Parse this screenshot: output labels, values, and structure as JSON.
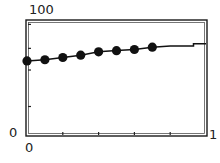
{
  "chart_data": {
    "type": "line",
    "title": "",
    "xlabel": "",
    "ylabel": "",
    "xlim": [
      0,
      1
    ],
    "ylim": [
      0,
      100
    ],
    "x_tick_labels": [
      "0",
      "1"
    ],
    "y_tick_labels": [
      "0",
      "100"
    ],
    "x_minor_ticks": [
      0.2,
      0.4,
      0.6,
      0.8
    ],
    "y_minor_ticks": [
      25,
      57,
      76,
      97
    ],
    "grid": false,
    "legend": null,
    "series": [
      {
        "name": "markers",
        "style": "line+filled-circle-markers",
        "color": "#111111",
        "x": [
          0.0,
          0.1,
          0.2,
          0.3,
          0.4,
          0.5,
          0.6,
          0.7
        ],
        "y": [
          65,
          66,
          68,
          70,
          73,
          74,
          75,
          77
        ]
      },
      {
        "name": "continuation",
        "style": "line",
        "color": "#111111",
        "x": [
          0.7,
          0.8,
          0.93,
          0.93,
          1.0
        ],
        "y": [
          77,
          78,
          78,
          80,
          80
        ]
      }
    ]
  },
  "labels": {
    "y_max": "100",
    "y_min": "0",
    "x_min": "0",
    "x_max": "1"
  }
}
